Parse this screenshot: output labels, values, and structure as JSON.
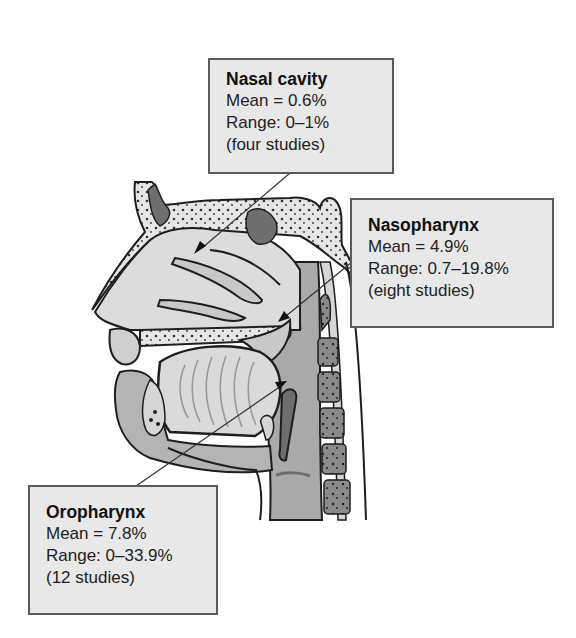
{
  "figure": {
    "regions": [
      {
        "name": "Nasal cavity",
        "mean": "Mean = 0.6%",
        "range": "Range: 0–1%",
        "studies": "(four studies)"
      },
      {
        "name": "Nasopharynx",
        "mean": "Mean = 4.9%",
        "range": "Range: 0.7–19.8%",
        "studies": "(eight studies)"
      },
      {
        "name": "Oropharynx",
        "mean": "Mean = 7.8%",
        "range": "Range: 0–33.9%",
        "studies": "(12 studies)"
      }
    ]
  },
  "colors": {
    "box_fill": "#e8e8e8",
    "box_border": "#5a5a5a",
    "tissue_light": "#dcdcdc",
    "tissue_mid": "#b4b4b4",
    "tissue_dark": "#6e6e6e",
    "outline": "#1e1e1e"
  }
}
